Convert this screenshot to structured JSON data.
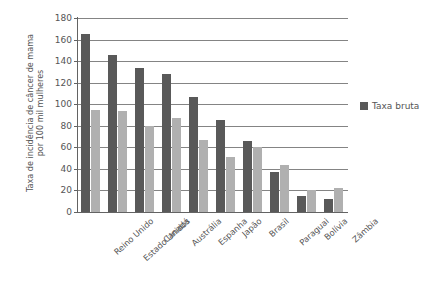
{
  "chart_data": {
    "type": "bar",
    "title": "",
    "subtitle": "",
    "xlabel": "",
    "ylabel": "Taxa de incidência de câncer de mama por 100 mil mulheres",
    "ylabel_lines": [
      "Taxa de incidência de câncer de mama",
      "por 100 mil mulheres"
    ],
    "categories": [
      "Reino Unido",
      "Estado Unidos",
      "Canadá",
      "Austrália",
      "Espanha",
      "Japão",
      "Brasil",
      "Paraguai",
      "Bolívia",
      "Zâmbia"
    ],
    "series": [
      {
        "name": "Taxa bruta",
        "color": "#595959",
        "values": [
          165,
          146,
          134,
          128,
          107,
          85,
          66,
          37,
          15,
          12
        ]
      },
      {
        "name": "",
        "color": "#b0b0b0",
        "values": [
          95,
          94,
          80,
          87,
          67,
          51,
          60,
          44,
          20,
          22
        ]
      }
    ],
    "ylim": [
      0,
      180
    ],
    "ytick_step": 20,
    "yticks": [
      0,
      20,
      40,
      60,
      80,
      100,
      120,
      140,
      160,
      180
    ],
    "ytick_labels": [
      "0",
      "20",
      "40",
      "60",
      "80",
      "100",
      "120",
      "140",
      "160",
      "180"
    ],
    "grid": true,
    "grid_axis": "y",
    "grid_color": "#848484",
    "legend": {
      "position": "right",
      "entries": [
        {
          "label": "Taxa bruta",
          "color": "#595959"
        }
      ]
    },
    "background_color": "#ffffff",
    "axis_color": "#636363"
  }
}
